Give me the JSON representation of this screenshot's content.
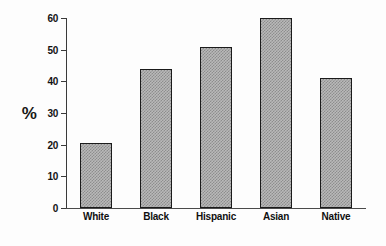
{
  "chart_data": {
    "type": "bar",
    "title": "",
    "subtitle": "",
    "xlabel": "",
    "ylabel": "%",
    "categories": [
      "White",
      "Black",
      "Hispanic",
      "Asian",
      "Native"
    ],
    "values": [
      20.5,
      44,
      51,
      60,
      41
    ],
    "series": [
      {
        "name": "",
        "values": [
          20.5,
          44,
          51,
          60,
          41
        ]
      }
    ],
    "ylim": [
      0,
      60
    ],
    "yticks": [
      0,
      10,
      20,
      30,
      40,
      50,
      60
    ],
    "ytick_labels": [
      "0",
      "10",
      "20",
      "30",
      "40",
      "50",
      "60"
    ],
    "grid": false,
    "legend": false,
    "legend_position": "none",
    "annotations": [],
    "colors": {
      "bar_fill": "#b9b9b9",
      "bar_pattern": "#8d8d8d",
      "bar_border": "#1b1b1b",
      "axis": "#3a3a3a",
      "text": "#101010",
      "background": "#fdfdfd"
    }
  }
}
